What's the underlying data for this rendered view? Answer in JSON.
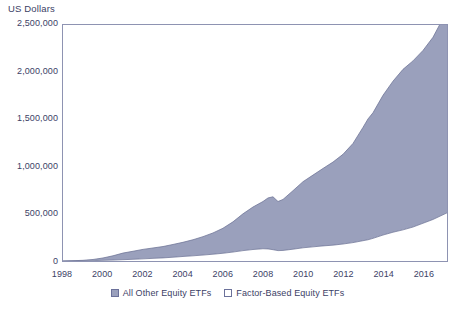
{
  "chart_data": {
    "type": "area",
    "title": "",
    "subtitle": "",
    "xlabel": "",
    "ylabel": "US Dollars",
    "stacked": true,
    "grid": false,
    "legend_position": "bottom-center",
    "xlim": [
      1998,
      2017.2
    ],
    "ylim": [
      0,
      2500000
    ],
    "ytick_labels": [
      "0",
      "500,000",
      "1,000,000",
      "1,500,000",
      "2,000,000",
      "2,500,000"
    ],
    "ytick_values": [
      0,
      500000,
      1000000,
      1500000,
      2000000,
      2500000
    ],
    "xtick_labels": [
      "1998",
      "2000",
      "2002",
      "2004",
      "2006",
      "2008",
      "2010",
      "2012",
      "2014",
      "2016"
    ],
    "xtick_values": [
      1998,
      2000,
      2002,
      2004,
      2006,
      2008,
      2010,
      2012,
      2014,
      2016
    ],
    "colors": {
      "all_other": "#9aa0bc",
      "factor_based": "#ffffff",
      "axis": "#8e93b2",
      "text": "#3c4166"
    },
    "x": [
      1998.0,
      1998.5,
      1999.0,
      1999.5,
      2000.0,
      2000.5,
      2001.0,
      2001.5,
      2002.0,
      2002.5,
      2003.0,
      2003.5,
      2004.0,
      2004.5,
      2005.0,
      2005.5,
      2006.0,
      2006.5,
      2007.0,
      2007.5,
      2008.0,
      2008.25,
      2008.5,
      2008.75,
      2009.0,
      2009.5,
      2010.0,
      2010.5,
      2011.0,
      2011.5,
      2012.0,
      2012.5,
      2013.0,
      2013.25,
      2013.5,
      2014.0,
      2014.5,
      2015.0,
      2015.5,
      2016.0,
      2016.5,
      2017.0,
      2017.2
    ],
    "series": [
      {
        "name": "Factor-Based Equity ETFs",
        "values": [
          0,
          1000,
          2000,
          4000,
          7000,
          10000,
          14000,
          18000,
          23000,
          28000,
          33000,
          40000,
          48000,
          55000,
          63000,
          72000,
          82000,
          95000,
          110000,
          122000,
          130000,
          128000,
          120000,
          110000,
          112000,
          125000,
          140000,
          150000,
          160000,
          168000,
          180000,
          195000,
          215000,
          225000,
          240000,
          275000,
          305000,
          330000,
          360000,
          400000,
          440000,
          490000,
          510000
        ]
      },
      {
        "name": "All Other Equity ETFs",
        "values": [
          0,
          2000,
          5000,
          12000,
          25000,
          45000,
          70000,
          85000,
          100000,
          110000,
          120000,
          135000,
          150000,
          170000,
          195000,
          225000,
          265000,
          320000,
          390000,
          450000,
          500000,
          540000,
          560000,
          520000,
          540000,
          620000,
          700000,
          760000,
          820000,
          880000,
          950000,
          1050000,
          1200000,
          1280000,
          1330000,
          1480000,
          1600000,
          1700000,
          1760000,
          1830000,
          1930000,
          2080000,
          2160000
        ]
      }
    ],
    "legend": [
      {
        "label": "All Other Equity ETFs",
        "swatch": "filled",
        "color": "#9aa0bc"
      },
      {
        "label": "Factor-Based Equity ETFs",
        "swatch": "empty",
        "color": "#ffffff"
      }
    ]
  }
}
